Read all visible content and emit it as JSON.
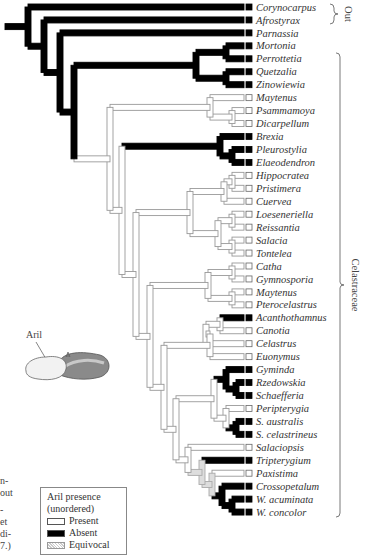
{
  "colors": {
    "present": "#ffffff",
    "absent": "#000000",
    "equivocal": "#cfcfcf",
    "line": "#999999",
    "text": "#333333"
  },
  "row_start_y": 7,
  "row_spacing": 12.95,
  "taxa": [
    {
      "name": "Corynocarpus",
      "state": "absent"
    },
    {
      "name": "Afrostyrax",
      "state": "absent"
    },
    {
      "name": "Parnassia",
      "state": "absent"
    },
    {
      "name": "Mortonia",
      "state": "absent"
    },
    {
      "name": "Perrottetia",
      "state": "absent"
    },
    {
      "name": "Quetzalia",
      "state": "absent"
    },
    {
      "name": "Zinowiewia",
      "state": "absent"
    },
    {
      "name": "Maytenus",
      "state": "present"
    },
    {
      "name": "Psammamoya",
      "state": "present"
    },
    {
      "name": "Dicarpellum",
      "state": "present"
    },
    {
      "name": "Brexia",
      "state": "absent"
    },
    {
      "name": "Pleurostylia",
      "state": "absent"
    },
    {
      "name": "Elaeodendron",
      "state": "absent"
    },
    {
      "name": "Hippocratea",
      "state": "present"
    },
    {
      "name": "Pristimera",
      "state": "present"
    },
    {
      "name": "Cuervea",
      "state": "present"
    },
    {
      "name": "Loeseneriella",
      "state": "present"
    },
    {
      "name": "Reissantia",
      "state": "present"
    },
    {
      "name": "Salacia",
      "state": "present"
    },
    {
      "name": "Tontelea",
      "state": "present"
    },
    {
      "name": "Catha",
      "state": "present"
    },
    {
      "name": "Gymnosporia",
      "state": "present"
    },
    {
      "name": "Maytenus",
      "state": "present"
    },
    {
      "name": "Pterocelastrus",
      "state": "present"
    },
    {
      "name": "Acanthothamnus",
      "state": "absent"
    },
    {
      "name": "Canotia",
      "state": "present"
    },
    {
      "name": "Celastrus",
      "state": "present"
    },
    {
      "name": "Euonymus",
      "state": "present"
    },
    {
      "name": "Gyminda",
      "state": "absent"
    },
    {
      "name": "Rzedowskia",
      "state": "absent"
    },
    {
      "name": "Schaefferia",
      "state": "absent"
    },
    {
      "name": "Peripterygia",
      "state": "present"
    },
    {
      "name": "S. australis",
      "state": "absent"
    },
    {
      "name": "S. celastrineus",
      "state": "absent"
    },
    {
      "name": "Salaciopsis",
      "state": "present"
    },
    {
      "name": "Tripterygium",
      "state": "absent"
    },
    {
      "name": "Paxistima",
      "state": "present"
    },
    {
      "name": "Crossopetalum",
      "state": "absent"
    },
    {
      "name": "W. acuminata",
      "state": "absent"
    },
    {
      "name": "W. concolor",
      "state": "absent"
    }
  ],
  "brackets": {
    "out": {
      "label": "Out",
      "from": 0,
      "to": 1
    },
    "ingroup": {
      "label": "Celastraceae",
      "from": 2,
      "to": 39
    }
  },
  "legend": {
    "title_line1": "Aril presence",
    "title_line2": "(unordered)",
    "items": [
      {
        "label": "Present",
        "state": "present"
      },
      {
        "label": "Absent",
        "state": "absent"
      },
      {
        "label": "Equivocal",
        "state": "equivocal"
      }
    ]
  },
  "aril_illustration": {
    "label": "Aril"
  },
  "caption_fragments": [
    "n-",
    "out",
    "-",
    "et",
    "di-",
    "7.)"
  ],
  "tree": {
    "node_x": {
      "root": 5,
      "n1": 14,
      "n2": 28,
      "n3": 44,
      "n4": 60,
      "n_mort": 226,
      "n_quetz": 226,
      "n5": 74,
      "n6": 88,
      "n7": 100,
      "n_mayt_psam": 210,
      "n_psam": 232,
      "n8": 110,
      "n_brexia": 220,
      "n_pleu": 232,
      "n9": 122,
      "n_hip": 148,
      "n_hip2": 172,
      "n_hippo": 224,
      "n_hip_a": 190,
      "n_lo": 218,
      "n_lo2": 232,
      "n_sal": 232,
      "n_hp": 232,
      "n10": 136,
      "n_ca": 196,
      "n_ca2": 208,
      "n_catha": 232,
      "n_may2": 232,
      "n11": 150,
      "n_aca": 206,
      "n_aca2": 220,
      "n_cel": 190,
      "n_eu": 210,
      "n12": 164,
      "n_gy": 214,
      "n_gy2": 226,
      "n_rz": 236,
      "n_per": 208,
      "n_sa": 226,
      "n_sa2": 236,
      "n13": 176,
      "n_sl": 188,
      "n_tr": 202,
      "n_tr2": 212,
      "n_cr": 222,
      "n_w": 232
    }
  }
}
